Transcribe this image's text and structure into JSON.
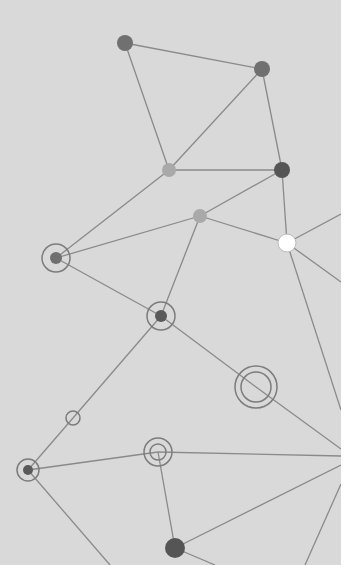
{
  "canvas": {
    "width": 355,
    "height": 565,
    "panel_width": 341,
    "background": "#d9d9d9",
    "margin_color": "#ffffff",
    "edge_color": "#8a8a8a"
  },
  "nodes": [
    {
      "id": "n1",
      "x": 125,
      "y": 43,
      "r": 8,
      "type": "filled",
      "color": "#707070"
    },
    {
      "id": "n2",
      "x": 262,
      "y": 69,
      "r": 8,
      "type": "filled",
      "color": "#707070"
    },
    {
      "id": "n3",
      "x": 169,
      "y": 170,
      "r": 7,
      "type": "filled",
      "color": "#a9a9a9"
    },
    {
      "id": "n4",
      "x": 282,
      "y": 170,
      "r": 8,
      "type": "filled",
      "color": "#555555"
    },
    {
      "id": "n5",
      "x": 200,
      "y": 216,
      "r": 7,
      "type": "filled",
      "color": "#a9a9a9"
    },
    {
      "id": "n6",
      "x": 287,
      "y": 243,
      "r": 9,
      "type": "filled",
      "color": "#ffffff",
      "stroke": "#bbbbbb"
    },
    {
      "id": "n7",
      "x": 56,
      "y": 258,
      "r": 14,
      "type": "ring-dot",
      "inner_r": 6,
      "color": "#707070"
    },
    {
      "id": "n8",
      "x": 161,
      "y": 316,
      "r": 14,
      "type": "ring-dot",
      "inner_r": 6,
      "color": "#5a5a5a"
    },
    {
      "id": "n9",
      "x": 256,
      "y": 387,
      "r": 21,
      "type": "double-ring",
      "inner_r": 15
    },
    {
      "id": "n10",
      "x": 73,
      "y": 418,
      "r": 7,
      "type": "ring"
    },
    {
      "id": "n11",
      "x": 158,
      "y": 452,
      "r": 14,
      "type": "double-ring",
      "inner_r": 8
    },
    {
      "id": "n12",
      "x": 28,
      "y": 470,
      "r": 11,
      "type": "ring-dot",
      "inner_r": 5,
      "color": "#5a5a5a"
    },
    {
      "id": "n13",
      "x": 175,
      "y": 548,
      "r": 10,
      "type": "filled",
      "color": "#555555"
    }
  ],
  "edges": [
    [
      125,
      43,
      262,
      69
    ],
    [
      125,
      43,
      169,
      170
    ],
    [
      262,
      69,
      169,
      170
    ],
    [
      262,
      69,
      282,
      170
    ],
    [
      169,
      170,
      282,
      170
    ],
    [
      169,
      170,
      56,
      258
    ],
    [
      282,
      170,
      200,
      216
    ],
    [
      282,
      170,
      287,
      243
    ],
    [
      200,
      216,
      56,
      258
    ],
    [
      200,
      216,
      287,
      243
    ],
    [
      200,
      216,
      161,
      316
    ],
    [
      287,
      243,
      341,
      214
    ],
    [
      287,
      243,
      341,
      282
    ],
    [
      287,
      243,
      341,
      410
    ],
    [
      56,
      258,
      161,
      316
    ],
    [
      161,
      316,
      256,
      387
    ],
    [
      161,
      316,
      73,
      418
    ],
    [
      256,
      387,
      341,
      449
    ],
    [
      73,
      418,
      28,
      470
    ],
    [
      28,
      470,
      158,
      452
    ],
    [
      28,
      470,
      110,
      565
    ],
    [
      158,
      452,
      341,
      456
    ],
    [
      158,
      452,
      175,
      548
    ],
    [
      175,
      548,
      341,
      465
    ],
    [
      175,
      548,
      215,
      565
    ],
    [
      341,
      484,
      305,
      565
    ]
  ]
}
